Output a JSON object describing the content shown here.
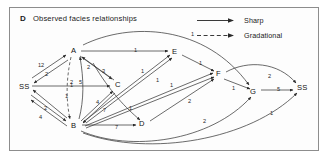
{
  "panel": {
    "letter": "D",
    "title": "Observed facies relationships"
  },
  "legend": {
    "items": [
      {
        "label": "Sharp",
        "style": "solid",
        "icon": "solid-arrow-icon"
      },
      {
        "label": "Gradational",
        "style": "dashed",
        "icon": "dashed-arrow-icon"
      }
    ]
  },
  "colors": {
    "border": "#8d8d8d",
    "line": "#3a3a3a",
    "text": "#121212",
    "background": "#fdfdfd"
  },
  "graph": {
    "nodes": [
      {
        "id": "SS_left",
        "label": "SS",
        "x": 23,
        "y": 87
      },
      {
        "id": "A",
        "label": "A",
        "x": 75,
        "y": 51
      },
      {
        "id": "B",
        "label": "B",
        "x": 75,
        "y": 126
      },
      {
        "id": "C",
        "label": "C",
        "x": 119,
        "y": 85
      },
      {
        "id": "D",
        "label": "D",
        "x": 143,
        "y": 124
      },
      {
        "id": "E",
        "label": "E",
        "x": 176,
        "y": 52
      },
      {
        "id": "F",
        "label": "F",
        "x": 220,
        "y": 74
      },
      {
        "id": "G",
        "label": "G",
        "x": 254,
        "y": 92
      },
      {
        "id": "SS_right",
        "label": "SS",
        "x": 301,
        "y": 88
      }
    ],
    "edges": [
      {
        "from": "A",
        "to": "SS_left",
        "label": "12",
        "style": "solid",
        "lx": 38,
        "ly": 62
      },
      {
        "from": "SS_left",
        "to": "A",
        "label": "2",
        "style": "solid",
        "lx": 45,
        "ly": 71
      },
      {
        "from": "SS_left",
        "to": "C",
        "label": "1",
        "style": "solid",
        "lx": 70,
        "ly": 82
      },
      {
        "from": "B",
        "to": "SS_left",
        "label": "1",
        "style": "solid",
        "lx": 65,
        "ly": 93
      },
      {
        "from": "SS_left",
        "to": "B",
        "label": "2",
        "style": "solid",
        "lx": 44,
        "ly": 105
      },
      {
        "from": "B",
        "to": "SS_left",
        "label": "4",
        "style": "solid",
        "lx": 39,
        "ly": 114
      },
      {
        "from": "A",
        "to": "B",
        "label": "2",
        "style": "dashed",
        "lx": 70,
        "ly": 79
      },
      {
        "from": "B",
        "to": "A",
        "label": "5",
        "style": "solid",
        "lx": 79,
        "ly": 79
      },
      {
        "from": "A",
        "to": "C",
        "label": "2",
        "style": "solid",
        "lx": 87,
        "ly": 64
      },
      {
        "from": "C",
        "to": "A",
        "label": "3",
        "style": "solid",
        "lx": 102,
        "ly": 68
      },
      {
        "from": "B",
        "to": "C",
        "label": "4",
        "style": "solid",
        "lx": 96,
        "ly": 99
      },
      {
        "from": "C",
        "to": "B",
        "label": "7",
        "style": "solid",
        "lx": 103,
        "ly": 107
      },
      {
        "from": "A",
        "to": "E",
        "label": "1",
        "style": "solid",
        "lx": 134,
        "ly": 47
      },
      {
        "from": "A",
        "to": "G",
        "label": "1",
        "style": "solid",
        "lx": 191,
        "ly": 31
      },
      {
        "from": "B",
        "to": "E",
        "label": "1",
        "style": "solid",
        "lx": 141,
        "ly": 68
      },
      {
        "from": "B",
        "to": "E",
        "label": "1",
        "style": "solid",
        "lx": 156,
        "ly": 77
      },
      {
        "from": "B",
        "to": "F",
        "label": "1",
        "style": "solid",
        "lx": 170,
        "ly": 82
      },
      {
        "from": "B",
        "to": "D",
        "label": "7",
        "style": "solid",
        "lx": 115,
        "ly": 124
      },
      {
        "from": "A",
        "to": "D",
        "label": "1",
        "style": "solid",
        "lx": 129,
        "ly": 105
      },
      {
        "from": "D",
        "to": "F",
        "label": "2",
        "style": "solid",
        "lx": 188,
        "ly": 98
      },
      {
        "from": "E",
        "to": "F",
        "label": "1",
        "style": "solid",
        "lx": 199,
        "ly": 60
      },
      {
        "from": "F",
        "to": "G",
        "label": "1",
        "style": "solid",
        "lx": 232,
        "ly": 85
      },
      {
        "from": "F",
        "to": "SS_right",
        "label": "2",
        "style": "solid",
        "lx": 268,
        "ly": 73
      },
      {
        "from": "G",
        "to": "SS_right",
        "label": "5",
        "style": "solid",
        "lx": 277,
        "ly": 86
      },
      {
        "from": "B",
        "to": "G",
        "label": "2",
        "style": "solid",
        "lx": 203,
        "ly": 118
      },
      {
        "from": "B",
        "to": "SS_right",
        "label": "1",
        "style": "solid",
        "lx": 270,
        "ly": 110
      }
    ]
  }
}
